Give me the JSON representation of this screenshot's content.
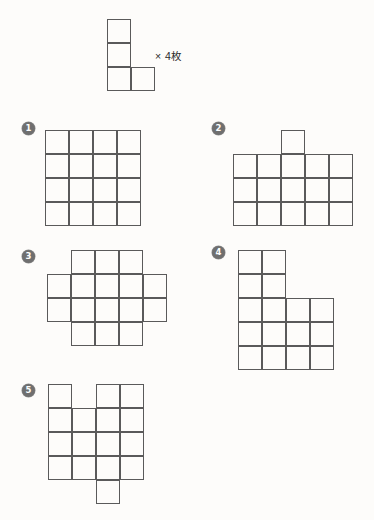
{
  "page": {
    "background_color": "#fdfcfa",
    "stroke_color": "#5a5a5a",
    "cell_size_px": 24
  },
  "prompt": {
    "piece_name": "L-tetromino",
    "quantity_label": "× 4枚",
    "cells": [
      [
        0,
        0
      ],
      [
        0,
        1
      ],
      [
        0,
        2
      ],
      [
        1,
        2
      ]
    ],
    "origin": {
      "x": 107,
      "y": 19
    }
  },
  "options": [
    {
      "marker": "❶",
      "number": "1",
      "name": "option-1-square-4x4",
      "marker_pos": {
        "x": 22,
        "y": 122
      },
      "origin": {
        "x": 45,
        "y": 130
      },
      "cells": [
        [
          0,
          0
        ],
        [
          1,
          0
        ],
        [
          2,
          0
        ],
        [
          3,
          0
        ],
        [
          0,
          1
        ],
        [
          1,
          1
        ],
        [
          2,
          1
        ],
        [
          3,
          1
        ],
        [
          0,
          2
        ],
        [
          1,
          2
        ],
        [
          2,
          2
        ],
        [
          3,
          2
        ],
        [
          0,
          3
        ],
        [
          1,
          3
        ],
        [
          2,
          3
        ],
        [
          3,
          3
        ]
      ]
    },
    {
      "marker": "❷",
      "number": "2",
      "name": "option-2-rect-with-bump",
      "marker_pos": {
        "x": 212,
        "y": 122
      },
      "origin": {
        "x": 233,
        "y": 130
      },
      "cells": [
        [
          2,
          0
        ],
        [
          0,
          1
        ],
        [
          1,
          1
        ],
        [
          2,
          1
        ],
        [
          3,
          1
        ],
        [
          4,
          1
        ],
        [
          0,
          2
        ],
        [
          1,
          2
        ],
        [
          2,
          2
        ],
        [
          3,
          2
        ],
        [
          4,
          2
        ],
        [
          0,
          3
        ],
        [
          1,
          3
        ],
        [
          2,
          3
        ],
        [
          3,
          3
        ],
        [
          4,
          3
        ]
      ]
    },
    {
      "marker": "❸",
      "number": "3",
      "name": "option-3-cross",
      "marker_pos": {
        "x": 22,
        "y": 250
      },
      "origin": {
        "x": 47,
        "y": 250
      },
      "cells": [
        [
          1,
          0
        ],
        [
          2,
          0
        ],
        [
          3,
          0
        ],
        [
          0,
          1
        ],
        [
          1,
          1
        ],
        [
          2,
          1
        ],
        [
          3,
          1
        ],
        [
          4,
          1
        ],
        [
          0,
          2
        ],
        [
          1,
          2
        ],
        [
          2,
          2
        ],
        [
          3,
          2
        ],
        [
          4,
          2
        ],
        [
          1,
          3
        ],
        [
          2,
          3
        ],
        [
          3,
          3
        ]
      ]
    },
    {
      "marker": "❹",
      "number": "4",
      "name": "option-4-L-block",
      "marker_pos": {
        "x": 212,
        "y": 246
      },
      "origin": {
        "x": 238,
        "y": 250
      },
      "cells": [
        [
          0,
          0
        ],
        [
          1,
          0
        ],
        [
          0,
          1
        ],
        [
          1,
          1
        ],
        [
          0,
          2
        ],
        [
          1,
          2
        ],
        [
          2,
          2
        ],
        [
          3,
          2
        ],
        [
          0,
          3
        ],
        [
          1,
          3
        ],
        [
          2,
          3
        ],
        [
          3,
          3
        ],
        [
          0,
          4
        ],
        [
          1,
          4
        ],
        [
          2,
          4
        ],
        [
          3,
          4
        ]
      ]
    },
    {
      "marker": "❺",
      "number": "5",
      "name": "option-5-notched-with-tail",
      "marker_pos": {
        "x": 22,
        "y": 384
      },
      "origin": {
        "x": 48,
        "y": 384
      },
      "cells": [
        [
          0,
          0
        ],
        [
          2,
          0
        ],
        [
          3,
          0
        ],
        [
          0,
          1
        ],
        [
          1,
          1
        ],
        [
          2,
          1
        ],
        [
          3,
          1
        ],
        [
          0,
          2
        ],
        [
          1,
          2
        ],
        [
          2,
          2
        ],
        [
          3,
          2
        ],
        [
          0,
          3
        ],
        [
          1,
          3
        ],
        [
          2,
          3
        ],
        [
          3,
          3
        ],
        [
          2,
          4
        ]
      ]
    }
  ]
}
